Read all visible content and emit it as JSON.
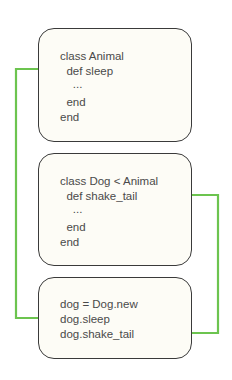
{
  "boxes": [
    {
      "name": "animal-class",
      "lines": [
        "class Animal",
        "  def sleep",
        "    ...",
        "  end",
        "end"
      ]
    },
    {
      "name": "dog-class",
      "lines": [
        "class Dog < Animal",
        "  def shake_tail",
        "    ...",
        "  end",
        "end"
      ]
    },
    {
      "name": "usage",
      "lines": [
        "dog = Dog.new",
        "dog.sleep",
        "dog.shake_tail"
      ]
    }
  ],
  "colors": {
    "arrow": "#6cc44f",
    "border": "#3a3a3a",
    "box_fill": "#fdfcf6",
    "text": "#4a4a4a"
  }
}
